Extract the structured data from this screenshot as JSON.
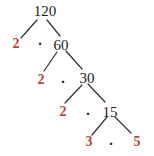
{
  "figure_title": "Factor tree of 120",
  "colors": {
    "background": "#ffffff",
    "node_text": "#1c1c1c",
    "factor_text": "#bf4136",
    "line": "#2e2e2e"
  },
  "tree": {
    "root": "120",
    "levels": [
      {
        "factor": "2",
        "operator": "·",
        "composite": "60"
      },
      {
        "factor": "2",
        "operator": "·",
        "composite": "30"
      },
      {
        "factor": "2",
        "operator": "·",
        "composite": "15"
      },
      {
        "factor": "3",
        "operator": "·",
        "factor2": "5"
      }
    ]
  }
}
